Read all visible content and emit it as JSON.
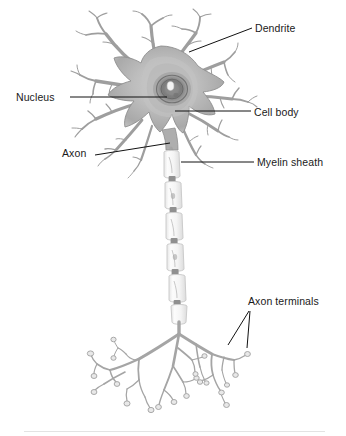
{
  "figure": {
    "background_color": "#ffffff",
    "divider_color": "#e3e3e3"
  },
  "labels": {
    "dendrite": "Dendrite",
    "nucleus": "Nucleus",
    "cell_body": "Cell body",
    "axon": "Axon",
    "myelin_sheath": "Myelin sheath",
    "axon_terminals": "Axon terminals"
  },
  "colors": {
    "label_text": "#1a1a1a",
    "leader_line": "#111111",
    "soma_fill": "#b9b9b9",
    "soma_edge": "#8e8e8e",
    "nucleus_dark": "#6f6f6f",
    "nucleolus": "#f2f2f2",
    "dendrite_stroke": "#9a9a9a",
    "myelin_fill": "#fbfbfb",
    "myelin_edge": "#cfcfcf",
    "node_of_ranvier": "#9b9b9b",
    "terminal_stroke": "#a3a3a3"
  },
  "structures": [
    {
      "name": "dendrite",
      "description": "Branching processes radiating from the cell body"
    },
    {
      "name": "nucleus",
      "description": "Dark concentric ring with bright nucleolus inside the soma"
    },
    {
      "name": "cell-body",
      "description": "Soma, the large central gray mass"
    },
    {
      "name": "axon",
      "description": "Long process descending from the soma"
    },
    {
      "name": "myelin-sheath",
      "description": "Chain of pale capsule segments separated by nodes of Ranvier"
    },
    {
      "name": "axon-terminals",
      "description": "Terminal arborization with bulbous end knobs"
    }
  ]
}
